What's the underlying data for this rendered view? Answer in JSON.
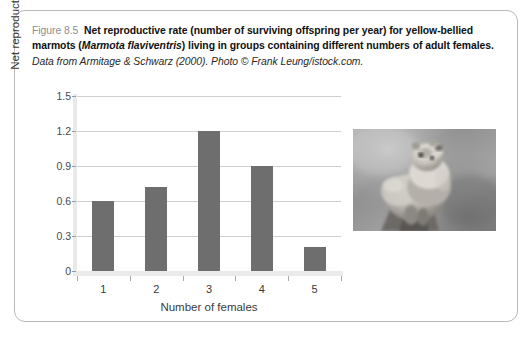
{
  "caption": {
    "figure_number": "Figure 8.5",
    "bold_part_1": "Net reproductive rate (number of surviving offspring per year) for yellow-bellied marmots (",
    "species_italic": "Marmota flaviventris",
    "bold_part_2": ") living in groups containing different numbers of adult females.",
    "source": "Data from Armitage & Schwarz (2000). Photo © Frank Leung/istock.com."
  },
  "photo": {
    "alt": "yellow-bellied marmot standing on a rock",
    "name": "marmot-photo"
  },
  "chart_data": {
    "type": "bar",
    "title": "",
    "categories": [
      "1",
      "2",
      "3",
      "4",
      "5"
    ],
    "values": [
      0.6,
      0.72,
      1.2,
      0.9,
      0.21
    ],
    "xlabel": "Number of females",
    "ylabel": "Net reproductive rate",
    "ylim": [
      0,
      1.5
    ],
    "yticks": [
      0,
      0.3,
      0.6,
      0.9,
      1.2,
      1.5
    ],
    "ytick_labels": [
      "0",
      "0.3",
      "0.6",
      "0.9",
      "1.2",
      "1.5"
    ],
    "grid": true,
    "legend": false,
    "bar_color": "#6e6e6e",
    "gridline_color": "#cfcfcf",
    "axis_color": "#e9e9e9"
  }
}
